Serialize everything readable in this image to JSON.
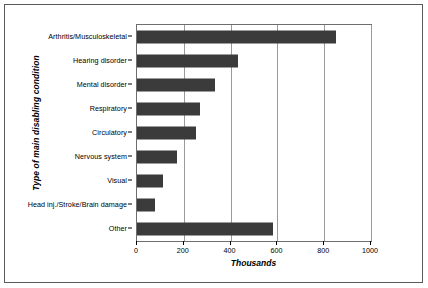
{
  "chart_data": {
    "type": "bar",
    "orientation": "horizontal",
    "title": "",
    "xlabel": "Thousands",
    "ylabel": "Type of main disabling condition",
    "categories": [
      "Arthritis/Musculoskeletal",
      "Hearing disorder",
      "Mental disorder",
      "Respiratory",
      "Circulatory",
      "Nervous system",
      "Visual",
      "Head inj./Stroke/Brain damage",
      "Other"
    ],
    "values": [
      850,
      430,
      335,
      270,
      250,
      170,
      110,
      75,
      580
    ],
    "xlim": [
      0,
      1000
    ],
    "xticks": [
      0,
      200,
      400,
      600,
      800,
      1000
    ],
    "xtick_labels": [
      "0",
      "200",
      "400",
      "600",
      "800",
      "1000"
    ],
    "grid": "vertical",
    "legend": "none",
    "bar_color": "#3b3b3b",
    "gridline_color": "#9a9a9a",
    "frame_color": "#6e6e6e",
    "background_color": "#ffffff"
  }
}
